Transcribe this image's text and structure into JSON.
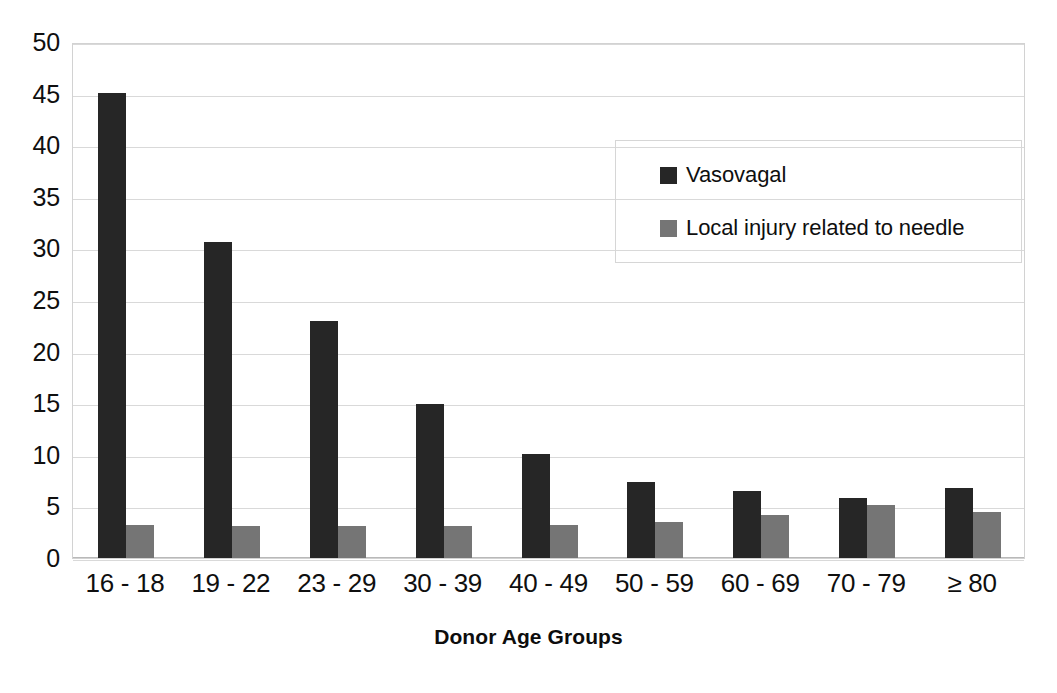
{
  "chart_data": {
    "type": "bar",
    "title": "",
    "xlabel": "Donor Age Groups",
    "ylabel": "",
    "ylim": [
      0,
      50
    ],
    "ytick_step": 5,
    "yticks": [
      "0",
      "5",
      "10",
      "15",
      "20",
      "25",
      "30",
      "35",
      "40",
      "45",
      "50"
    ],
    "grid": true,
    "legend_position": "inside-upper-right",
    "categories": [
      "16 - 18",
      "19 - 22",
      "23 - 29",
      "30 - 39",
      "40 - 49",
      "50 - 59",
      "60 - 69",
      "70 - 79",
      "≥ 80"
    ],
    "series": [
      {
        "name": "Vasovagal",
        "color": "#262626",
        "values": [
          45.1,
          30.6,
          23.0,
          14.9,
          10.1,
          7.4,
          6.5,
          5.8,
          6.8
        ]
      },
      {
        "name": "Local injury related to needle",
        "color": "#757575",
        "values": [
          3.2,
          3.1,
          3.1,
          3.1,
          3.2,
          3.5,
          4.2,
          5.1,
          4.5
        ]
      }
    ]
  },
  "legend": {
    "items": [
      {
        "label": "Vasovagal",
        "color": "#262626"
      },
      {
        "label": "Local injury related to needle",
        "color": "#757575"
      }
    ]
  },
  "axis": {
    "x_title": "Donor Age Groups"
  },
  "colors": {
    "series_0": "#262626",
    "series_1": "#757575",
    "gridline": "#d9d9d9",
    "plot_border": "#d2d2d2",
    "background": "#ffffff",
    "text": "#0f0f0f"
  }
}
